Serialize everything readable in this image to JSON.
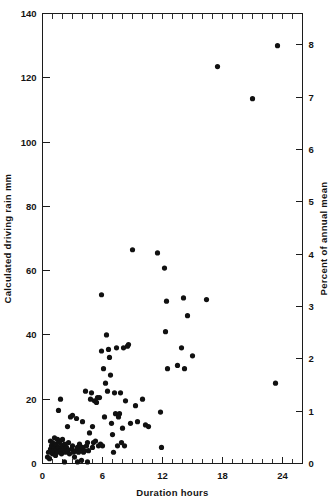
{
  "chart_data": {
    "type": "scatter",
    "title": "",
    "xlabel": "Duration hours",
    "ylabel": "Calculated driving rain  mm",
    "y2label": "Percent of annual mean",
    "xlim": [
      0,
      26
    ],
    "ylim": [
      0,
      140
    ],
    "y2lim": [
      0,
      8.6
    ],
    "grid": false,
    "legend": null,
    "xticks": [
      0,
      6,
      12,
      18,
      24
    ],
    "xticklabels": [
      "0",
      "6",
      "12",
      "18",
      "24"
    ],
    "x_minor_tick_step": 1,
    "yticks": [
      0,
      20,
      40,
      60,
      80,
      100,
      120,
      140
    ],
    "yticklabels": [
      "0",
      "20",
      "40",
      "60",
      "80",
      "100",
      "120",
      "140"
    ],
    "y2ticks": [
      0,
      1,
      2,
      3,
      4,
      5,
      6,
      7,
      8
    ],
    "y2ticklabels": [
      "0",
      "1",
      "2",
      "3",
      "4",
      "5",
      "6",
      "7",
      "8"
    ],
    "marker": "filled-circle",
    "marker_color": "#111111",
    "marker_size_px": 2.6,
    "points": [
      [
        0.5,
        2.0
      ],
      [
        0.6,
        3.5
      ],
      [
        0.7,
        1.5
      ],
      [
        0.8,
        4.5
      ],
      [
        0.8,
        7.0
      ],
      [
        0.9,
        5.5
      ],
      [
        1.0,
        3.0
      ],
      [
        1.0,
        6.5
      ],
      [
        1.1,
        4.0
      ],
      [
        1.2,
        5.0
      ],
      [
        1.2,
        8.0
      ],
      [
        1.3,
        2.5
      ],
      [
        1.3,
        6.0
      ],
      [
        1.4,
        4.5
      ],
      [
        1.5,
        7.5
      ],
      [
        1.5,
        3.5
      ],
      [
        1.6,
        5.0
      ],
      [
        1.6,
        16.5
      ],
      [
        1.7,
        6.5
      ],
      [
        1.8,
        4.0
      ],
      [
        1.8,
        20.0
      ],
      [
        1.9,
        3.0
      ],
      [
        2.0,
        5.5
      ],
      [
        2.0,
        7.5
      ],
      [
        2.1,
        4.5
      ],
      [
        2.2,
        6.0
      ],
      [
        2.2,
        0.5
      ],
      [
        2.3,
        3.5
      ],
      [
        2.4,
        5.0
      ],
      [
        2.5,
        4.0
      ],
      [
        2.5,
        11.5
      ],
      [
        2.6,
        6.5
      ],
      [
        2.7,
        3.0
      ],
      [
        2.8,
        14.5
      ],
      [
        2.9,
        4.5
      ],
      [
        3.0,
        5.5
      ],
      [
        3.0,
        15.0
      ],
      [
        3.1,
        3.5
      ],
      [
        3.2,
        2.0
      ],
      [
        3.3,
        4.0
      ],
      [
        3.4,
        14.0
      ],
      [
        3.5,
        5.0
      ],
      [
        3.5,
        0.5
      ],
      [
        3.6,
        3.5
      ],
      [
        3.7,
        6.0
      ],
      [
        3.8,
        4.5
      ],
      [
        3.9,
        1.0
      ],
      [
        4.0,
        5.0
      ],
      [
        4.0,
        13.0
      ],
      [
        4.1,
        3.5
      ],
      [
        4.2,
        4.0
      ],
      [
        4.3,
        22.5
      ],
      [
        4.4,
        5.5
      ],
      [
        4.5,
        0.5
      ],
      [
        4.5,
        6.5
      ],
      [
        4.6,
        4.0
      ],
      [
        4.7,
        9.5
      ],
      [
        4.8,
        20.0
      ],
      [
        4.9,
        22.0
      ],
      [
        5.0,
        5.0
      ],
      [
        5.0,
        11.5
      ],
      [
        5.1,
        6.5
      ],
      [
        5.2,
        19.5
      ],
      [
        5.3,
        7.0
      ],
      [
        5.4,
        19.0
      ],
      [
        5.5,
        20.5
      ],
      [
        5.6,
        5.5
      ],
      [
        5.7,
        20.5
      ],
      [
        5.8,
        6.0
      ],
      [
        5.9,
        35.0
      ],
      [
        5.9,
        52.5
      ],
      [
        6.0,
        5.5
      ],
      [
        6.1,
        29.5
      ],
      [
        6.2,
        14.5
      ],
      [
        6.3,
        25.0
      ],
      [
        6.4,
        40.0
      ],
      [
        6.5,
        22.5
      ],
      [
        6.6,
        35.5
      ],
      [
        6.7,
        33.0
      ],
      [
        6.8,
        27.5
      ],
      [
        6.9,
        12.5
      ],
      [
        7.0,
        9.0
      ],
      [
        7.1,
        3.5
      ],
      [
        7.2,
        22.0
      ],
      [
        7.3,
        15.5
      ],
      [
        7.4,
        36.0
      ],
      [
        7.5,
        5.5
      ],
      [
        7.6,
        14.5
      ],
      [
        7.7,
        15.5
      ],
      [
        7.8,
        22.0
      ],
      [
        7.9,
        6.5
      ],
      [
        8.0,
        11.0
      ],
      [
        8.1,
        36.0
      ],
      [
        8.2,
        5.5
      ],
      [
        8.3,
        19.5
      ],
      [
        8.5,
        36.5
      ],
      [
        8.6,
        37.0
      ],
      [
        8.8,
        12.5
      ],
      [
        9.0,
        66.5
      ],
      [
        9.3,
        18.0
      ],
      [
        9.5,
        13.0
      ],
      [
        10.0,
        20.0
      ],
      [
        10.3,
        12.0
      ],
      [
        10.6,
        11.5
      ],
      [
        11.5,
        65.5
      ],
      [
        11.8,
        16.0
      ],
      [
        11.9,
        5.0
      ],
      [
        12.2,
        60.8
      ],
      [
        12.3,
        41.0
      ],
      [
        12.4,
        50.5
      ],
      [
        12.5,
        29.5
      ],
      [
        13.5,
        30.5
      ],
      [
        13.9,
        36.0
      ],
      [
        14.1,
        51.5
      ],
      [
        14.2,
        29.5
      ],
      [
        14.5,
        46.0
      ],
      [
        15.0,
        33.5
      ],
      [
        16.4,
        51.0
      ],
      [
        17.5,
        123.5
      ],
      [
        21.0,
        113.5
      ],
      [
        23.3,
        25.0
      ],
      [
        23.5,
        130.0
      ]
    ]
  },
  "axes": {
    "left_title": "Calculated driving rain  mm",
    "right_title": "Percent of annual mean",
    "bottom_title": "Duration hours"
  }
}
